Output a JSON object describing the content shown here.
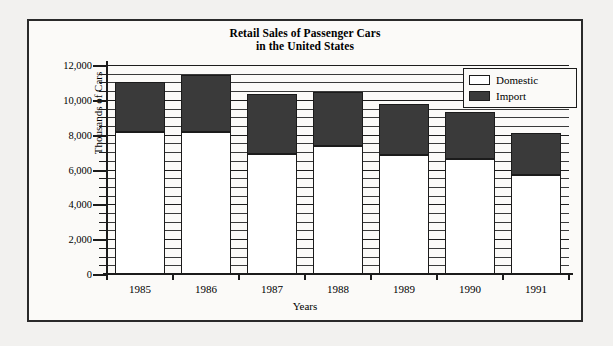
{
  "chart_data": {
    "type": "bar",
    "stacked": true,
    "title": "Retail Sales of Passenger Cars in the United States",
    "title_lines": [
      "Retail Sales of Passenger Cars",
      "in the United States"
    ],
    "xlabel": "Years",
    "ylabel": "Thousands of Cars",
    "categories": [
      "1985",
      "1986",
      "1987",
      "1988",
      "1989",
      "1990",
      "1991"
    ],
    "series": [
      {
        "name": "Domestic",
        "color": "#ffffff",
        "values": [
          8150,
          8150,
          6900,
          7350,
          6850,
          6600,
          5700
        ]
      },
      {
        "name": "Import",
        "color": "#3a3a3a",
        "values": [
          2850,
          3250,
          3450,
          3100,
          2900,
          2700,
          2400
        ]
      }
    ],
    "totals": [
      11000,
      11400,
      10350,
      10450,
      9750,
      9300,
      8100
    ],
    "ylim": [
      0,
      12000
    ],
    "ytick_step": 2000,
    "yminor_step": 500,
    "ytick_labels": [
      "0",
      "2,000",
      "4,000",
      "6,000",
      "8,000",
      "10,000",
      "12,000"
    ],
    "ytick_values": [
      0,
      2000,
      4000,
      6000,
      8000,
      10000,
      12000
    ],
    "grid": true,
    "grid_orientation": "horizontal",
    "legend_position": "top-right",
    "legend": [
      {
        "label": "Domestic",
        "swatch": "white"
      },
      {
        "label": "Import",
        "swatch": "dark"
      }
    ]
  }
}
